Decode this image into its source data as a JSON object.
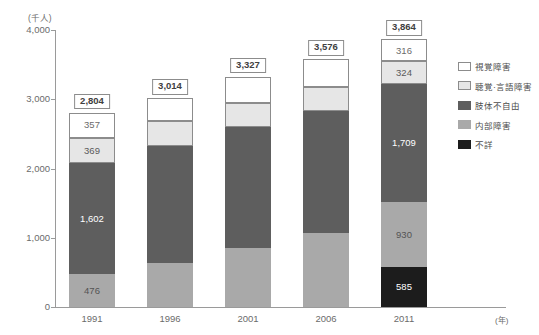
{
  "chart_data": {
    "type": "bar",
    "subtype": "stacked-vertical",
    "title": "",
    "xlabel": "(年)",
    "ylabel": "(千人)",
    "categories": [
      "1991",
      "1996",
      "2001",
      "2006",
      "2011"
    ],
    "ylim": [
      0,
      4000
    ],
    "ytick_labels": [
      "0",
      "1,000",
      "2,000",
      "3,000",
      "4,000"
    ],
    "ytick_values": [
      0,
      1000,
      2000,
      3000,
      4000
    ],
    "grid": false,
    "legend_position": "right",
    "totals": [
      "2,804",
      "3,014",
      "3,327",
      "3,576",
      "3,864"
    ],
    "total_values": [
      2804,
      3014,
      3327,
      3576,
      3864
    ],
    "series": [
      {
        "name": "不詳",
        "key": "unknown",
        "color": "#1c1c1c",
        "values": [
          0,
          0,
          0,
          0,
          585
        ],
        "labels": [
          "",
          "",
          "",
          "",
          "585"
        ]
      },
      {
        "name": "内部障害",
        "key": "internal",
        "color": "#a9a9a9",
        "values": [
          476,
          631,
          849,
          1070,
          930
        ],
        "labels": [
          "476",
          "",
          "",
          "",
          "930"
        ]
      },
      {
        "name": "肢体不自由",
        "key": "limb",
        "color": "#5e5e5e",
        "values": [
          1602,
          1698,
          1749,
          1760,
          1709
        ],
        "labels": [
          "1,602",
          "",
          "",
          "",
          "1,709"
        ]
      },
      {
        "name": "聴覚·言語障害",
        "key": "hearing",
        "color": "#e6e6e6",
        "values": [
          369,
          350,
          346,
          343,
          324
        ],
        "labels": [
          "369",
          "",
          "",
          "",
          "324"
        ]
      },
      {
        "name": "視覚障害",
        "key": "visual",
        "color": "#ffffff",
        "values": [
          357,
          335,
          383,
          403,
          316
        ],
        "labels": [
          "357",
          "",
          "",
          "",
          "316"
        ]
      }
    ]
  },
  "axes": {
    "y_unit_label": "(千人)",
    "x_unit_label": "(年)",
    "y_ticks": [
      "4,000",
      "3,000",
      "2,000",
      "1,000",
      "0"
    ]
  },
  "legend": {
    "items": [
      {
        "label": "視覚障害",
        "swatch": "sw-visual"
      },
      {
        "label": "聴覚·言語障害",
        "swatch": "sw-hearing"
      },
      {
        "label": "肢体不自由",
        "swatch": "sw-limb"
      },
      {
        "label": "内部障害",
        "swatch": "sw-internal"
      },
      {
        "label": "不詳",
        "swatch": "sw-unknown"
      }
    ]
  }
}
